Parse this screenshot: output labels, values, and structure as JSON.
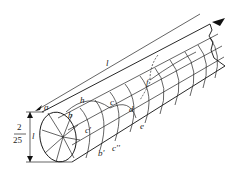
{
  "diagram": {
    "labels": {
      "a": "a",
      "b": "b",
      "b_prime": "b'",
      "c": "c",
      "c_prime": "c'",
      "c_double_prime": "c''",
      "d": "d",
      "e": "e",
      "f": "f",
      "h": "h",
      "length": "l"
    },
    "dimension": {
      "numerator": "2",
      "denominator": "25",
      "variable": "l"
    }
  }
}
